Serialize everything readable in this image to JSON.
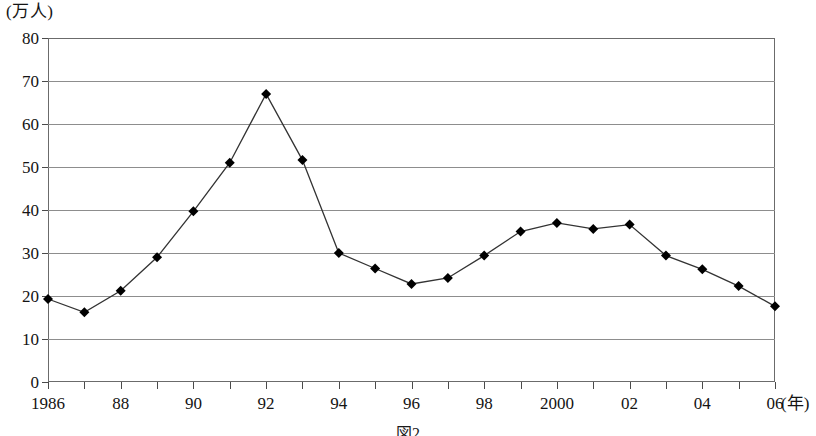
{
  "chart_data": {
    "type": "line",
    "title": "",
    "subtitle": "",
    "xlabel": "(年)",
    "ylabel": "(万人)",
    "unit_label": "(万人)",
    "xlim": [
      1986,
      2006
    ],
    "ylim": [
      0,
      80
    ],
    "ytick_step": 10,
    "grid": true,
    "legend": "none",
    "marker": "filled-diamond",
    "marker_color": "#000000",
    "line_color": "#333333",
    "x": [
      1986,
      1987,
      1988,
      1989,
      1990,
      1991,
      1992,
      1993,
      1994,
      1995,
      1996,
      1997,
      1998,
      1999,
      2000,
      2001,
      2002,
      2003,
      2004,
      2005,
      2006
    ],
    "values": [
      19.3,
      16.2,
      21.2,
      29.0,
      39.7,
      51.0,
      67.0,
      51.6,
      30.0,
      26.4,
      22.8,
      24.2,
      29.4,
      35.0,
      37.0,
      35.6,
      36.6,
      29.4,
      26.2,
      22.3,
      17.6
    ],
    "ytick_labels": [
      "80",
      "70",
      "60",
      "50",
      "40",
      "30",
      "20",
      "10",
      "0"
    ],
    "ytick_values": [
      80,
      70,
      60,
      50,
      40,
      30,
      20,
      10,
      0
    ],
    "xtick_labels": [
      {
        "value": 1986,
        "label": "1986"
      },
      {
        "value": 1987,
        "label": ""
      },
      {
        "value": 1988,
        "label": "88"
      },
      {
        "value": 1989,
        "label": ""
      },
      {
        "value": 1990,
        "label": "90"
      },
      {
        "value": 1991,
        "label": ""
      },
      {
        "value": 1992,
        "label": "92"
      },
      {
        "value": 1993,
        "label": ""
      },
      {
        "value": 1994,
        "label": "94"
      },
      {
        "value": 1995,
        "label": ""
      },
      {
        "value": 1996,
        "label": "96"
      },
      {
        "value": 1997,
        "label": ""
      },
      {
        "value": 1998,
        "label": "98"
      },
      {
        "value": 1999,
        "label": ""
      },
      {
        "value": 2000,
        "label": "2000"
      },
      {
        "value": 2001,
        "label": ""
      },
      {
        "value": 2002,
        "label": "02"
      },
      {
        "value": 2003,
        "label": ""
      },
      {
        "value": 2004,
        "label": "04"
      },
      {
        "value": 2005,
        "label": ""
      },
      {
        "value": 2006,
        "label": "06"
      }
    ]
  },
  "caption": {
    "text": "図2"
  }
}
